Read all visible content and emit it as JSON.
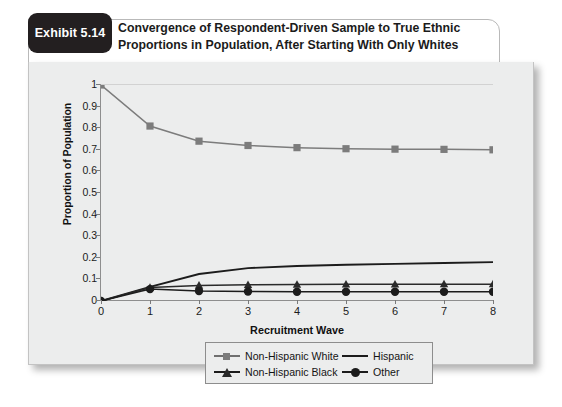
{
  "exhibit": {
    "badge_label": "Exhibit 5.14",
    "title_line1": "Convergence of Respondent-Driven Sample to True Ethnic",
    "title_line2": "Proportions in Population, After Starting With Only Whites"
  },
  "chart_data": {
    "type": "line",
    "title": "Convergence of Respondent-Driven Sample to True Ethnic Proportions in Population, After Starting With Only Whites",
    "xlabel": "Recruitment Wave",
    "ylabel": "Proportion of Population",
    "x": [
      0,
      1,
      2,
      3,
      4,
      5,
      6,
      7,
      8
    ],
    "xlim": [
      0,
      8
    ],
    "ylim": [
      0,
      1
    ],
    "yticks": [
      "0",
      "0.1",
      "0.2",
      "0.3",
      "0.4",
      "0.5",
      "0.6",
      "0.7",
      "0.8",
      "0.9",
      "1"
    ],
    "ytick_values": [
      0,
      0.1,
      0.2,
      0.3,
      0.4,
      0.5,
      0.6,
      0.7,
      0.8,
      0.9,
      1
    ],
    "xticks": [
      "0",
      "1",
      "2",
      "3",
      "4",
      "5",
      "6",
      "7",
      "8"
    ],
    "grid": false,
    "legend_position": "bottom",
    "series": [
      {
        "name": "Non-Hispanic White",
        "marker": "square",
        "color": "#7c7c7c",
        "values": [
          1.0,
          0.81,
          0.74,
          0.72,
          0.71,
          0.705,
          0.703,
          0.702,
          0.7
        ]
      },
      {
        "name": "Hispanic",
        "marker": "none",
        "color": "#1c1c1c",
        "values": [
          0.0,
          0.065,
          0.125,
          0.152,
          0.162,
          0.168,
          0.172,
          0.176,
          0.18
        ]
      },
      {
        "name": "Non-Hispanic Black",
        "marker": "triangle",
        "color": "#2a2a2a",
        "values": [
          0.0,
          0.062,
          0.072,
          0.075,
          0.076,
          0.077,
          0.077,
          0.078,
          0.078
        ]
      },
      {
        "name": "Other",
        "marker": "circle",
        "color": "#1c1c1c",
        "values": [
          0.0,
          0.055,
          0.046,
          0.044,
          0.043,
          0.043,
          0.043,
          0.043,
          0.043
        ]
      }
    ]
  },
  "legend": {
    "items": [
      {
        "label": "Non-Hispanic White",
        "key": "square-line-key"
      },
      {
        "label": "Hispanic",
        "key": "plain-line-key"
      },
      {
        "label": "Non-Hispanic Black",
        "key": "triangle-line-key"
      },
      {
        "label": "Other",
        "key": "circle-line-key"
      }
    ]
  }
}
